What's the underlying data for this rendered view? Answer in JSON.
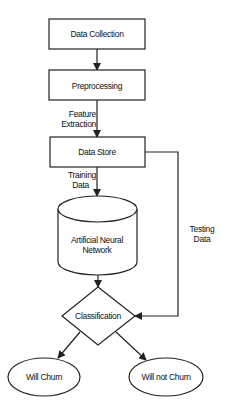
{
  "diagram": {
    "type": "flowchart",
    "nodes": {
      "data_collection": "Data Collection",
      "preprocessing": "Preprocessing",
      "data_store": "Data Store",
      "ann_line1": "Artificial Neural",
      "ann_line2": "Network",
      "classification": "Classification",
      "will_churn": "Will Churn",
      "will_not_churn": "Will not Churn"
    },
    "edge_labels": {
      "feature_line1": "Feature",
      "feature_line2": "Extraction",
      "training_line1": "Training",
      "training_line2": "Data",
      "testing_line1": "Testing",
      "testing_line2": "Data"
    },
    "edges": [
      {
        "from": "Data Collection",
        "to": "Preprocessing",
        "label": ""
      },
      {
        "from": "Preprocessing",
        "to": "Data Store",
        "label": "Feature Extraction"
      },
      {
        "from": "Data Store",
        "to": "Artificial Neural Network",
        "label": "Training Data"
      },
      {
        "from": "Data Store",
        "to": "Classification",
        "label": "Testing Data"
      },
      {
        "from": "Artificial Neural Network",
        "to": "Classification",
        "label": ""
      },
      {
        "from": "Classification",
        "to": "Will Churn",
        "label": ""
      },
      {
        "from": "Classification",
        "to": "Will not Churn",
        "label": ""
      }
    ]
  }
}
